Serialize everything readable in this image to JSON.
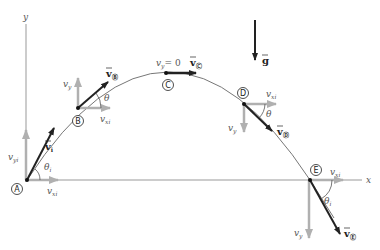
{
  "figure": {
    "type": "projectile-motion-trajectory",
    "axes": {
      "x_label": "x",
      "y_label": "y"
    },
    "gravity": {
      "label": "g"
    },
    "colors": {
      "trajectory": "#777777",
      "velocity_vector": "#222222",
      "component_vector": "#a8a8a8",
      "axis": "#888888",
      "text": "#555555"
    },
    "points": [
      {
        "id": "A",
        "velocity_label": "v",
        "velocity_sub": "i",
        "angle_label": "θ",
        "angle_sub": "i",
        "vx_label": "v",
        "vx_sub": "xi",
        "vy_label": "v",
        "vy_sub": "yi"
      },
      {
        "id": "B",
        "velocity_label": "v",
        "velocity_sub": "Ⓑ",
        "angle_label": "θ",
        "vx_label": "v",
        "vx_sub": "xi",
        "vy_label": "v",
        "vy_sub": "y"
      },
      {
        "id": "C",
        "velocity_label": "v",
        "velocity_sub": "Ⓒ",
        "vy_label": "v",
        "vy_sub": "y",
        "vy_eq": "= 0"
      },
      {
        "id": "D",
        "velocity_label": "v",
        "velocity_sub": "Ⓓ",
        "angle_label": "θ",
        "vx_label": "v",
        "vx_sub": "xi",
        "vy_label": "v",
        "vy_sub": "y"
      },
      {
        "id": "E",
        "velocity_label": "v",
        "velocity_sub": "Ⓔ",
        "angle_label": "θ",
        "angle_sub": "i",
        "vx_label": "v",
        "vx_sub": "xi",
        "vy_label": "v",
        "vy_sub": "y"
      }
    ]
  }
}
